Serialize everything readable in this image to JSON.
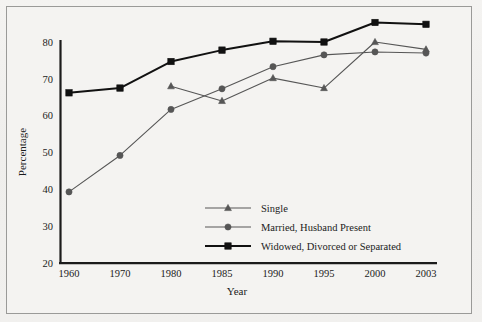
{
  "figure": {
    "background_color": "#f2f1ef",
    "border_color": "#9a9a98",
    "text_color": "#1b1b1b"
  },
  "chart_data": {
    "type": "line",
    "title": "",
    "xlabel": "Year",
    "ylabel": "Percentage",
    "categories": [
      "1960",
      "1970",
      "1980",
      "1985",
      "1990",
      "1995",
      "2000",
      "2003"
    ],
    "x": [
      1960,
      1970,
      1980,
      1985,
      1990,
      1995,
      2000,
      2003
    ],
    "ylim": [
      20,
      80
    ],
    "yticks": [
      20,
      30,
      40,
      50,
      60,
      70,
      80
    ],
    "ytick_labels": [
      "20",
      "30",
      "40",
      "50",
      "60",
      "70",
      "80"
    ],
    "grid": false,
    "legend_position": "lower center",
    "series": [
      {
        "name": "Single",
        "marker": "triangle",
        "color": "#565656",
        "line_width": 1.1,
        "values": [
          null,
          null,
          68.0,
          64.0,
          70.2,
          67.5,
          80.0,
          78.0
        ]
      },
      {
        "name": "Married, Husband Present",
        "marker": "circle",
        "color": "#565656",
        "line_width": 1.1,
        "values": [
          39.3,
          49.2,
          61.7,
          67.3,
          73.3,
          76.5,
          77.3,
          77.0
        ]
      },
      {
        "name": "Widowed, Divorced or Separated",
        "marker": "square",
        "color": "#111111",
        "line_width": 2.0,
        "values": [
          66.2,
          67.5,
          74.7,
          77.8,
          80.2,
          80.0,
          85.3,
          84.8
        ]
      }
    ]
  },
  "legend": {
    "items": [
      {
        "label": "Single",
        "marker": "triangle",
        "color": "#565656"
      },
      {
        "label": "Married, Husband Present",
        "marker": "circle",
        "color": "#565656"
      },
      {
        "label": "Widowed, Divorced or Separated",
        "marker": "square",
        "color": "#111111"
      }
    ]
  },
  "axes": {
    "y_label": "Percentage",
    "x_label": "Year",
    "y_tick_labels": [
      "80",
      "70",
      "60",
      "50",
      "40",
      "30",
      "20"
    ],
    "x_tick_labels": [
      "1960",
      "1970",
      "1980",
      "1985",
      "1990",
      "1995",
      "2000",
      "2003"
    ]
  }
}
